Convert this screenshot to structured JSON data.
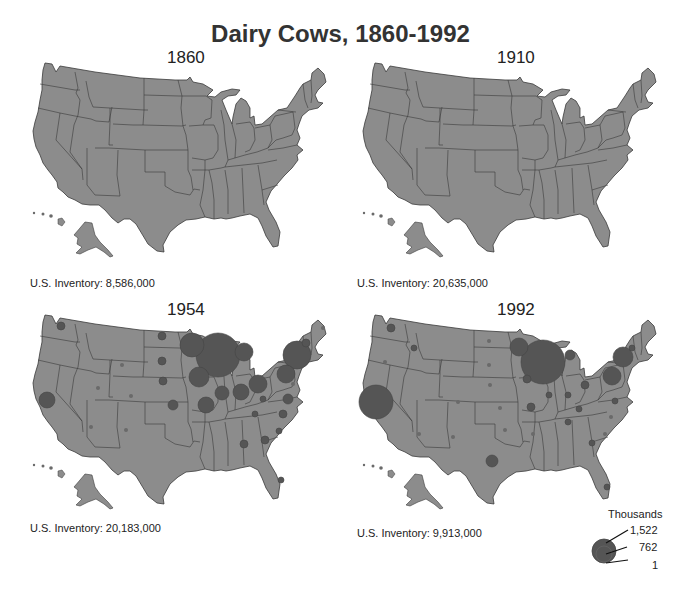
{
  "chart_data": {
    "type": "proportional-symbol-map",
    "title": "Dairy Cows, 1860-1992",
    "legend": {
      "title": "Thousands",
      "values": [
        "1,522",
        "762",
        "1"
      ]
    },
    "panels": [
      {
        "year": "1860",
        "inventory": "U.S. Inventory: 8,586,000",
        "ox": 0,
        "oy": 0,
        "circles": []
      },
      {
        "year": "1910",
        "inventory": "U.S. Inventory: 20,635,000",
        "ox": 330,
        "oy": 0,
        "circles": []
      },
      {
        "year": "1954",
        "inventory": "U.S. Inventory: 20,183,000",
        "ox": 0,
        "oy": 252,
        "circles": [
          {
            "state": "WI",
            "x": 218,
            "y": 103,
            "r": 22
          },
          {
            "state": "MN",
            "x": 192,
            "y": 93,
            "r": 12
          },
          {
            "state": "NY",
            "x": 297,
            "y": 103,
            "r": 14
          },
          {
            "state": "MI",
            "x": 244,
            "y": 100,
            "r": 9
          },
          {
            "state": "IA",
            "x": 199,
            "y": 125,
            "r": 10
          },
          {
            "state": "CA",
            "x": 47,
            "y": 148,
            "r": 8
          },
          {
            "state": "MO",
            "x": 206,
            "y": 153,
            "r": 8
          },
          {
            "state": "IL",
            "x": 222,
            "y": 141,
            "r": 7
          },
          {
            "state": "IN",
            "x": 241,
            "y": 140,
            "r": 8
          },
          {
            "state": "OH",
            "x": 258,
            "y": 132,
            "r": 9
          },
          {
            "state": "PA",
            "x": 286,
            "y": 122,
            "r": 9
          },
          {
            "state": "WA",
            "x": 61,
            "y": 74,
            "r": 4
          },
          {
            "state": "ND",
            "x": 162,
            "y": 84,
            "r": 4
          },
          {
            "state": "SD",
            "x": 162,
            "y": 109,
            "r": 4
          },
          {
            "state": "NE",
            "x": 163,
            "y": 129,
            "r": 4
          },
          {
            "state": "KS",
            "x": 173,
            "y": 153,
            "r": 5
          },
          {
            "state": "VA",
            "x": 288,
            "y": 147,
            "r": 5
          },
          {
            "state": "NC",
            "x": 283,
            "y": 162,
            "r": 4
          },
          {
            "state": "SC",
            "x": 279,
            "y": 179,
            "r": 3
          },
          {
            "state": "GA",
            "x": 265,
            "y": 188,
            "r": 4
          },
          {
            "state": "AL",
            "x": 244,
            "y": 192,
            "r": 4
          },
          {
            "state": "TN",
            "x": 255,
            "y": 162,
            "r": 3
          },
          {
            "state": "KY",
            "x": 263,
            "y": 147,
            "r": 3
          },
          {
            "state": "VT",
            "x": 306,
            "y": 91,
            "r": 4
          },
          {
            "state": "ME",
            "x": 323,
            "y": 76,
            "r": 2
          },
          {
            "state": "MD",
            "x": 293,
            "y": 132,
            "r": 2
          },
          {
            "state": "FL",
            "x": 281,
            "y": 228,
            "r": 3
          },
          {
            "state": "CO",
            "x": 131,
            "y": 144,
            "r": 2
          },
          {
            "state": "UT",
            "x": 98,
            "y": 136,
            "r": 2
          },
          {
            "state": "AZ",
            "x": 91,
            "y": 175,
            "r": 2
          },
          {
            "state": "NM",
            "x": 126,
            "y": 178,
            "r": 2
          },
          {
            "state": "WY",
            "x": 122,
            "y": 113,
            "r": 2
          }
        ]
      },
      {
        "year": "1992",
        "inventory": "U.S. Inventory: 9,913,000",
        "ox": 330,
        "oy": 252,
        "circles": [
          {
            "state": "WI",
            "x": 213,
            "y": 110,
            "r": 22
          },
          {
            "state": "CA",
            "x": 46,
            "y": 150,
            "r": 17
          },
          {
            "state": "NY",
            "x": 293,
            "y": 105,
            "r": 10
          },
          {
            "state": "MN",
            "x": 189,
            "y": 95,
            "r": 9
          },
          {
            "state": "PA",
            "x": 282,
            "y": 124,
            "r": 9
          },
          {
            "state": "TX",
            "x": 162,
            "y": 209,
            "r": 6
          },
          {
            "state": "MI",
            "x": 240,
            "y": 103,
            "r": 5
          },
          {
            "state": "WA",
            "x": 61,
            "y": 76,
            "r": 4
          },
          {
            "state": "ID",
            "x": 84,
            "y": 96,
            "r": 3
          },
          {
            "state": "OH",
            "x": 255,
            "y": 133,
            "r": 4
          },
          {
            "state": "IA",
            "x": 197,
            "y": 127,
            "r": 4
          },
          {
            "state": "MO",
            "x": 201,
            "y": 155,
            "r": 4
          },
          {
            "state": "VT",
            "x": 302,
            "y": 96,
            "r": 3
          },
          {
            "state": "IL",
            "x": 219,
            "y": 143,
            "r": 3
          },
          {
            "state": "IN",
            "x": 238,
            "y": 143,
            "r": 3
          },
          {
            "state": "KY",
            "x": 249,
            "y": 157,
            "r": 3
          },
          {
            "state": "VA",
            "x": 285,
            "y": 149,
            "r": 3
          },
          {
            "state": "TN",
            "x": 238,
            "y": 170,
            "r": 3
          },
          {
            "state": "NC",
            "x": 281,
            "y": 165,
            "r": 2
          },
          {
            "state": "SC",
            "x": 275,
            "y": 182,
            "r": 2
          },
          {
            "state": "GA",
            "x": 262,
            "y": 191,
            "r": 3
          },
          {
            "state": "FL",
            "x": 277,
            "y": 235,
            "r": 3
          },
          {
            "state": "NE",
            "x": 160,
            "y": 133,
            "r": 2
          },
          {
            "state": "KS",
            "x": 170,
            "y": 156,
            "r": 2
          },
          {
            "state": "OK",
            "x": 175,
            "y": 178,
            "r": 2
          },
          {
            "state": "AR",
            "x": 203,
            "y": 182,
            "r": 2
          },
          {
            "state": "AZ",
            "x": 89,
            "y": 182,
            "r": 2
          },
          {
            "state": "NM",
            "x": 123,
            "y": 185,
            "r": 2
          },
          {
            "state": "CO",
            "x": 128,
            "y": 150,
            "r": 2
          },
          {
            "state": "OR",
            "x": 55,
            "y": 110,
            "r": 2
          },
          {
            "state": "ND",
            "x": 159,
            "y": 89,
            "r": 2
          },
          {
            "state": "SD",
            "x": 159,
            "y": 113,
            "r": 2
          }
        ]
      }
    ]
  },
  "colors": {
    "land": "#8c8c8c",
    "border": "#3a3a3a",
    "circle": "#555555",
    "dot": "#6a6a6a"
  }
}
